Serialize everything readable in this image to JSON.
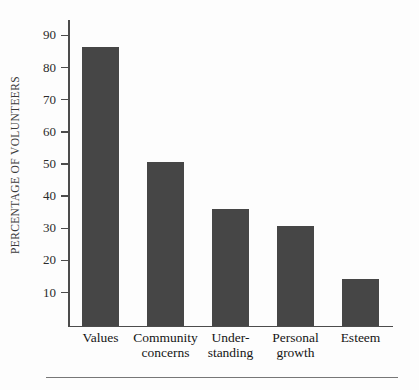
{
  "chart_data": {
    "type": "bar",
    "title": "",
    "subtitle": "",
    "xlabel": "",
    "ylabel": "PERCENTAGE OF VOLUNTEERS",
    "categories": [
      "Values",
      "Community concerns",
      "Under-standing",
      "Personal growth",
      "Esteem"
    ],
    "category_lines": [
      [
        "Values",
        ""
      ],
      [
        "Community",
        "concerns"
      ],
      [
        "Under-",
        "standing"
      ],
      [
        "Personal",
        "growth"
      ],
      [
        "Esteem",
        ""
      ]
    ],
    "values": [
      86.5,
      51,
      36.3,
      31,
      14.5
    ],
    "ylim": [
      0,
      95
    ],
    "yticks": [
      10,
      20,
      30,
      40,
      50,
      60,
      70,
      80,
      90
    ],
    "ytick_labels": [
      "10",
      "20",
      "30",
      "40",
      "50",
      "60",
      "70",
      "80",
      "90"
    ],
    "grid": false,
    "legend": "none",
    "bar_color": "#464646",
    "axis_color": "#4c4c4c",
    "background_color": "#fdfdfd"
  }
}
